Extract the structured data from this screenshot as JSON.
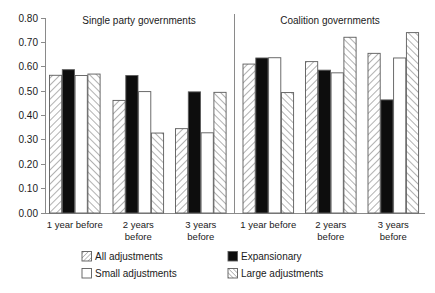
{
  "chart_data": {
    "type": "bar",
    "title": "",
    "xlabel": "",
    "ylabel": "",
    "ylim": [
      0.0,
      0.8
    ],
    "ytick_step": 0.1,
    "grid": false,
    "legend_position": "bottom",
    "panels": [
      "Single party governments",
      "Coalition governments"
    ],
    "yticks": [
      "0.00",
      "0.10",
      "0.20",
      "0.30",
      "0.40",
      "0.50",
      "0.60",
      "0.70",
      "0.80"
    ],
    "categories": [
      "1 year before",
      "2 years before",
      "3 years before",
      "1 year before",
      "2 years before",
      "3 years before"
    ],
    "category_lines": [
      [
        "1 year before",
        ""
      ],
      [
        "2 years",
        "before"
      ],
      [
        "3 years",
        "before"
      ],
      [
        "1 year before",
        ""
      ],
      [
        "2 years",
        "before"
      ],
      [
        "3 years",
        "before"
      ]
    ],
    "series": [
      {
        "name": "All adjustments",
        "style": "hatch-back",
        "values": [
          0.565,
          0.462,
          0.346,
          0.611,
          0.621,
          0.655
        ]
      },
      {
        "name": "Expansionary",
        "style": "solid-black",
        "values": [
          0.588,
          0.564,
          0.497,
          0.636,
          0.586,
          0.464
        ]
      },
      {
        "name": "Small adjustments",
        "style": "white",
        "values": [
          0.564,
          0.498,
          0.329,
          0.637,
          0.575,
          0.636
        ]
      },
      {
        "name": "Large adjustments",
        "style": "hatch-fwd",
        "values": [
          0.57,
          0.328,
          0.495,
          0.494,
          0.721,
          0.74
        ]
      }
    ]
  },
  "legend": {
    "items": [
      {
        "label": "All adjustments",
        "style": "hatch-back"
      },
      {
        "label": "Expansionary",
        "style": "solid-black"
      },
      {
        "label": "Small adjustments",
        "style": "white"
      },
      {
        "label": "Large adjustments",
        "style": "hatch-fwd"
      }
    ]
  },
  "colors": {
    "axis": "#8a8a8a",
    "bar_outline": "#5b5b5b",
    "black_fill": "#0d0d0d",
    "white_fill": "#ffffff",
    "hatch_stroke": "#707070",
    "text": "#1a1a1a",
    "background": "#ffffff"
  }
}
